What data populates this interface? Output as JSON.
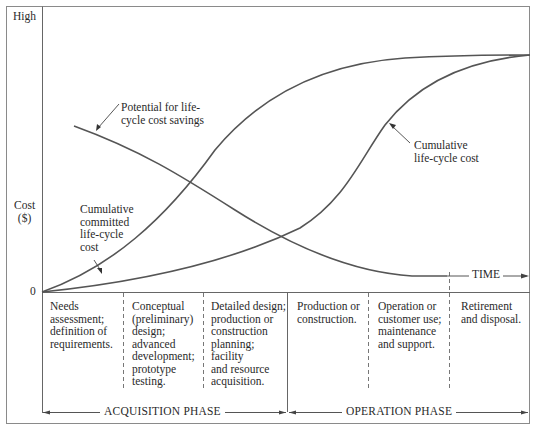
{
  "diagram": {
    "type": "life-cycle cost curves",
    "y_axis": {
      "title": "Cost\n($)",
      "top_label": "High",
      "zero_label": "0"
    },
    "x_axis": {
      "label": "TIME"
    },
    "curves": [
      {
        "id": "potential-savings",
        "label": "Potential for life-\ncycle cost savings",
        "trend": "decreasing"
      },
      {
        "id": "committed-cost",
        "label": "Cumulative\ncommitted\nlife-cycle\ncost",
        "trend": "increasing-early"
      },
      {
        "id": "cumulative-cost",
        "label": "Cumulative\nlife-cycle cost",
        "trend": "increasing-late"
      }
    ],
    "stages": [
      {
        "text": "Needs\nassessment;\ndefinition of\nrequirements."
      },
      {
        "text": "Conceptual\n(preliminary)\ndesign;\nadvanced\ndevelopment;\nprototype\ntesting."
      },
      {
        "text": "Detailed design;\nproduction or\nconstruction\nplanning;\nfacility\nand resource\nacquisition."
      },
      {
        "text": "Production or\nconstruction."
      },
      {
        "text": "Operation or\ncustomer use;\nmaintenance\nand support."
      },
      {
        "text": "Retirement\nand disposal."
      }
    ],
    "phases": [
      {
        "name": "ACQUISITION PHASE"
      },
      {
        "name": "OPERATION PHASE"
      }
    ]
  },
  "colors": {
    "line": "#555555",
    "frame": "#777777",
    "text": "#2a2a2a"
  }
}
